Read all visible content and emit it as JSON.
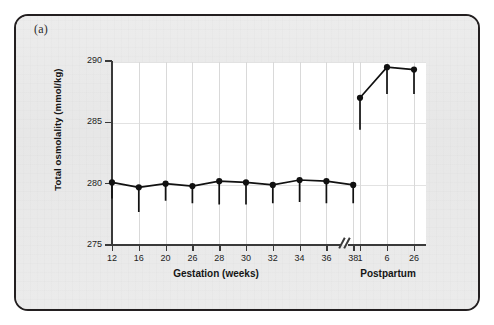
{
  "panel": {
    "label": "(a)"
  },
  "chart_data": {
    "type": "line",
    "title": "",
    "xlabel": "Gestation (weeks)",
    "xlabel_secondary": "Postpartum",
    "ylabel": "Total osmolality (mmol/kg)",
    "ylim": [
      275,
      290
    ],
    "ytick_labels": [
      "275",
      "280",
      "285",
      "290"
    ],
    "yticks": [
      275,
      280,
      285,
      290
    ],
    "grid": true,
    "grid_axis": "both",
    "legend": "none",
    "axis_break": true,
    "axis_break_symbol": "//",
    "error_bars": "lower-only",
    "marker": "filled-circle",
    "categories": [
      "12",
      "16",
      "20",
      "26",
      "28",
      "30",
      "32",
      "34",
      "36",
      "38",
      "1",
      "6",
      "26"
    ],
    "segments": [
      {
        "name": "Gestation (weeks)",
        "categories": [
          "12",
          "16",
          "20",
          "26",
          "28",
          "30",
          "32",
          "34",
          "36",
          "38"
        ],
        "values": [
          280.1,
          279.7,
          280.0,
          279.8,
          280.2,
          280.1,
          279.9,
          280.3,
          280.2,
          279.9
        ],
        "lower_error": [
          278.8,
          277.7,
          278.6,
          278.4,
          278.3,
          278.3,
          278.4,
          278.5,
          278.4,
          278.4
        ]
      },
      {
        "name": "Postpartum",
        "categories": [
          "1",
          "6",
          "26"
        ],
        "values": [
          287.0,
          289.5,
          289.3
        ],
        "lower_error": [
          284.4,
          287.3,
          287.3
        ]
      }
    ]
  },
  "colors": {
    "frame_border": "#231f20",
    "panel_background": "#e9e9e9",
    "plot_background": "#ffffff",
    "gridline": "#d9d9d9",
    "axis": "#3a3a3a",
    "series": "#111111"
  }
}
